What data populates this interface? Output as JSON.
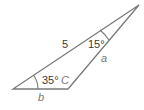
{
  "diagram": {
    "type": "triangle",
    "colors": {
      "stroke": "#7a7a7a",
      "text": "#3a3a3a",
      "variable_text": "#777777"
    },
    "vertices": {
      "left": {
        "x": 13,
        "y": 89
      },
      "C": {
        "x": 68,
        "y": 89
      },
      "top": {
        "x": 139,
        "y": 5
      }
    },
    "labels": {
      "side_hypotenuse": "5",
      "angle_top": "15°",
      "side_a": "a",
      "angle_left": "35°",
      "vertex_c": "C",
      "side_b": "b"
    }
  }
}
